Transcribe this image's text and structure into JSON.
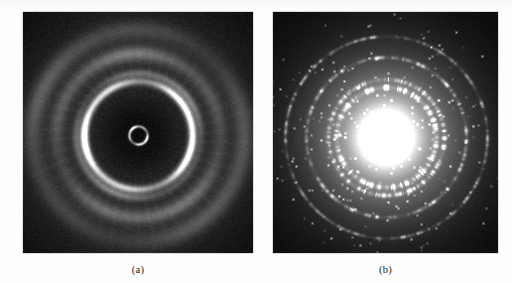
{
  "figure": {
    "background_color": "#fefefe",
    "panels": [
      {
        "id": "a",
        "caption": "(a)",
        "kind": "electron-diffraction-pattern",
        "description": "Amorphous / nanocrystalline ring pattern with smooth continuous halo rings",
        "frame": {
          "x": 23,
          "y": 12,
          "width": 230,
          "height": 241
        },
        "background_color": "#050505"
      },
      {
        "id": "b",
        "caption": "(b)",
        "kind": "electron-diffraction-pattern",
        "description": "Polycrystalline ring pattern with discrete diffraction spots on rings and bright central beam",
        "frame": {
          "x": 273,
          "y": 12,
          "width": 225,
          "height": 241
        },
        "background_color": "#050505"
      }
    ]
  },
  "chart_data": [
    {
      "type": "scatter",
      "title": "(a)",
      "panel": "a",
      "xlabel": "",
      "ylabel": "",
      "center": {
        "x": 115,
        "y": 123
      },
      "center_spot": {
        "type": "beam-stop-ring",
        "radius": 9,
        "intensity": 0.85,
        "thickness": 1.6
      },
      "background_level": 0.045,
      "halo_level": 0.1,
      "rings": [
        {
          "radius": 9,
          "intensity": 0.88,
          "thickness": 1.8,
          "style": "continuous",
          "label": "beam stop edge"
        },
        {
          "radius": 54,
          "intensity": 1.0,
          "thickness": 4.5,
          "style": "continuous",
          "label": "primary bright halo"
        },
        {
          "radius": 62,
          "intensity": 0.3,
          "thickness": 5.0,
          "style": "continuous",
          "label": "secondary faint halo"
        },
        {
          "radius": 82,
          "intensity": 0.26,
          "thickness": 7.0,
          "style": "diffuse",
          "label": "third diffuse halo"
        },
        {
          "radius": 106,
          "intensity": 0.2,
          "thickness": 9.0,
          "style": "diffuse",
          "label": "fourth diffuse halo"
        }
      ],
      "spots": [],
      "grid": false,
      "legend": "none"
    },
    {
      "type": "scatter",
      "title": "(b)",
      "panel": "b",
      "xlabel": "",
      "ylabel": "",
      "center": {
        "x": 113,
        "y": 125
      },
      "center_spot": {
        "type": "transmitted-beam",
        "radius": 30,
        "intensity": 1.0
      },
      "background_level": 0.015,
      "halo_level": 0.02,
      "rings": [
        {
          "radius": 50,
          "intensity": 0.95,
          "thickness": 3.0,
          "style": "spotty",
          "spot_count": 120,
          "label": "innermost diffraction ring"
        },
        {
          "radius": 58,
          "intensity": 0.8,
          "thickness": 2.6,
          "style": "spotty",
          "spot_count": 110,
          "label": "second diffraction ring"
        },
        {
          "radius": 80,
          "intensity": 0.6,
          "thickness": 2.2,
          "style": "spotty",
          "spot_count": 130,
          "label": "third diffraction ring"
        },
        {
          "radius": 101,
          "intensity": 0.5,
          "thickness": 2.0,
          "style": "spotty",
          "spot_count": 150,
          "label": "fourth diffraction ring"
        }
      ],
      "grid": false,
      "legend": "none"
    }
  ]
}
